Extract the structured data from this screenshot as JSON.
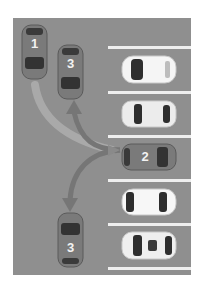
{
  "diagram": {
    "title": "",
    "colors": {
      "lot": "#8f8f8f",
      "line": "#eeeeee",
      "numbered_car_body": "#777777",
      "parked_car_body": "#f4f4f4",
      "arrow_light": "#a8a8a8",
      "arrow_dark": "#727272"
    },
    "numbered_cars": [
      {
        "label": "1",
        "orientation": "vertical",
        "heading": "down"
      },
      {
        "label": "3",
        "orientation": "vertical",
        "heading": "down",
        "position": "top"
      },
      {
        "label": "2",
        "orientation": "horizontal",
        "heading": "left"
      },
      {
        "label": "3",
        "orientation": "vertical",
        "heading": "up",
        "position": "bottom"
      }
    ],
    "parked_cars": [
      {
        "slot": 1,
        "color": "white",
        "heading": "left"
      },
      {
        "slot": 2,
        "color": "white",
        "heading": "left"
      },
      {
        "slot": 4,
        "color": "white",
        "heading": "left"
      },
      {
        "slot": 5,
        "color": "white",
        "heading": "left"
      }
    ],
    "arrows": [
      {
        "from": "car-1",
        "to": "car-2-slot",
        "style": "light"
      },
      {
        "from": "car-2",
        "to": "car-3-top",
        "style": "dark"
      },
      {
        "from": "car-2",
        "to": "car-3-bottom",
        "style": "dark"
      }
    ],
    "parking_lines": 6
  }
}
